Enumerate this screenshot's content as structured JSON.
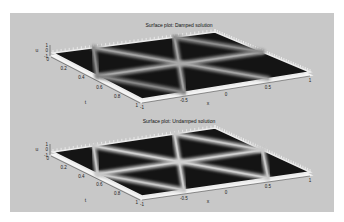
{
  "figure": {
    "background": "#c8c8c8",
    "surface_dark": "#141414",
    "ridge_light": "#d8d8d8"
  },
  "chart_data": [
    {
      "type": "surface",
      "title": "Surface plot: Damped solution",
      "xlabel": "x",
      "ylabel": "t",
      "zlabel": "u",
      "xlim": [
        -1,
        1
      ],
      "ylim": [
        0,
        1
      ],
      "zlim": [
        -1,
        1
      ],
      "xticks": [
        "-1",
        "-0.5",
        "0",
        "0.5",
        "1"
      ],
      "yticks": [
        "0",
        "0.2",
        "0.4",
        "0.6",
        "0.8",
        "1"
      ],
      "zticks": [
        "-1",
        "0",
        "1"
      ],
      "ridges": [
        {
          "from": [
            -0.5,
            0
          ],
          "to": [
            0.5,
            1
          ],
          "intensity": 0.55
        },
        {
          "from": [
            0.5,
            0
          ],
          "to": [
            -0.5,
            1
          ],
          "intensity": 0.55
        },
        {
          "from": [
            -1,
            0.5
          ],
          "to": [
            1,
            0.5
          ],
          "intensity": 0.6
        },
        {
          "from": [
            -0.5,
            0
          ],
          "to": [
            -1,
            0.5
          ],
          "intensity": 0.4
        },
        {
          "from": [
            0.5,
            0
          ],
          "to": [
            1,
            0.5
          ],
          "intensity": 0.4
        },
        {
          "from": [
            -1,
            0.5
          ],
          "to": [
            -0.5,
            1
          ],
          "intensity": 0.35
        }
      ],
      "edge_strip": "boundary"
    },
    {
      "type": "surface",
      "title": "Surface plot: Undamped solution",
      "xlabel": "x",
      "ylabel": "t",
      "zlabel": "u",
      "xlim": [
        -1,
        1
      ],
      "ylim": [
        0,
        1
      ],
      "zlim": [
        -1,
        1
      ],
      "xticks": [
        "-1",
        "-0.5",
        "0",
        "0.5",
        "1"
      ],
      "yticks": [
        "0",
        "0.2",
        "0.4",
        "0.6",
        "0.8",
        "1"
      ],
      "zticks": [
        "-1",
        "0",
        "1"
      ],
      "ridges": [
        {
          "from": [
            -0.5,
            0
          ],
          "to": [
            0.5,
            1
          ],
          "intensity": 0.85
        },
        {
          "from": [
            0.5,
            0
          ],
          "to": [
            -0.5,
            1
          ],
          "intensity": 0.85
        },
        {
          "from": [
            -1,
            0.5
          ],
          "to": [
            1,
            0.5
          ],
          "intensity": 0.85
        },
        {
          "from": [
            -0.5,
            0
          ],
          "to": [
            -1,
            0.5
          ],
          "intensity": 0.8
        },
        {
          "from": [
            0.5,
            0
          ],
          "to": [
            1,
            0.5
          ],
          "intensity": 0.8
        },
        {
          "from": [
            -1,
            0.5
          ],
          "to": [
            -0.5,
            1
          ],
          "intensity": 0.8
        },
        {
          "from": [
            1,
            0.5
          ],
          "to": [
            0.5,
            1
          ],
          "intensity": 0.8
        }
      ],
      "edge_strip": "boundary"
    }
  ]
}
